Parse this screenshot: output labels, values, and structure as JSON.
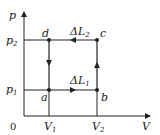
{
  "diagram": {
    "axes": {
      "y_label": "p",
      "x_label": "V",
      "origin_label": "0",
      "y_ticks": [
        {
          "label": "p",
          "sub": "2"
        },
        {
          "label": "p",
          "sub": "1"
        }
      ],
      "x_ticks": [
        {
          "label": "V",
          "sub": "1"
        },
        {
          "label": "V",
          "sub": "2"
        }
      ]
    },
    "points": [
      {
        "name": "a",
        "label": "a"
      },
      {
        "name": "b",
        "label": "b"
      },
      {
        "name": "c",
        "label": "c"
      },
      {
        "name": "d",
        "label": "d"
      }
    ],
    "paths": [
      {
        "from": "a",
        "to": "b",
        "label": "ΔL",
        "sub": "1"
      },
      {
        "from": "b",
        "to": "c",
        "label": ""
      },
      {
        "from": "c",
        "to": "d",
        "label": "ΔL",
        "sub": "2"
      },
      {
        "from": "d",
        "to": "a",
        "label": ""
      }
    ],
    "colors": {
      "line": "#222222",
      "background": "#ffffff"
    }
  }
}
